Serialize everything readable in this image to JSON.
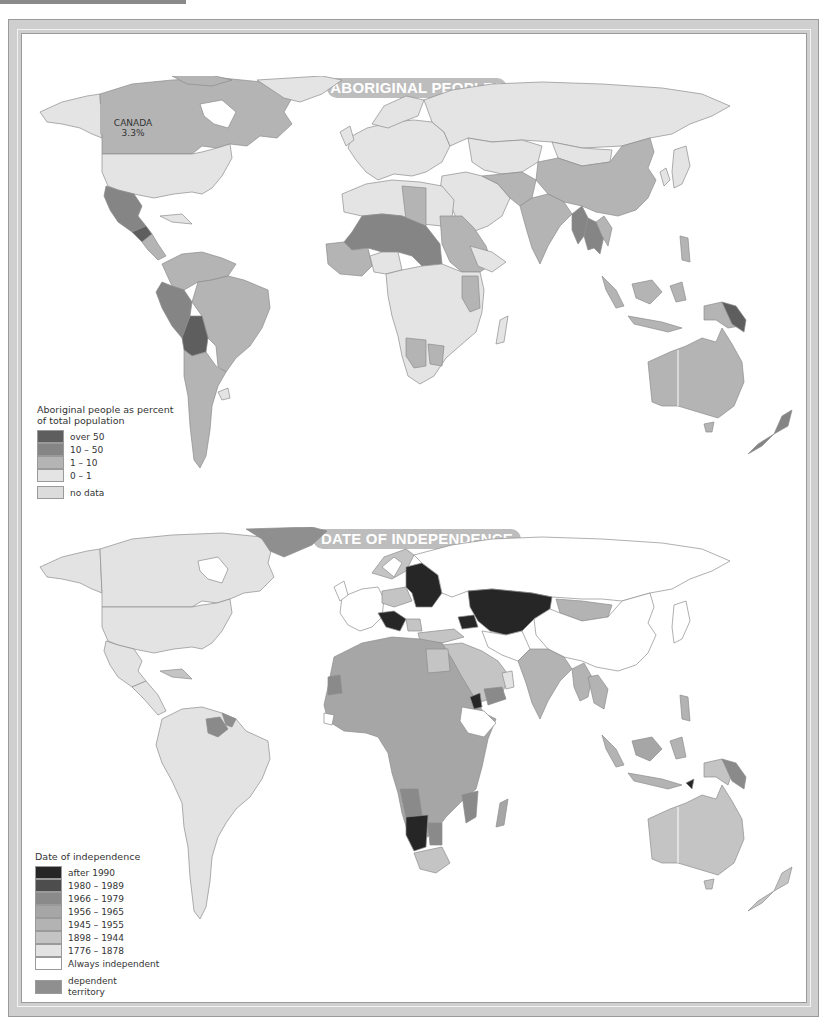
{
  "colors": {
    "frame": "#cfcfcf",
    "pill": "#bdbdbd",
    "sea": "#ffffff",
    "border": "#8c8c8c"
  },
  "maps": [
    {
      "title": "ABORIGINAL PEOPLES",
      "callout": {
        "country": "CANADA",
        "value": "3.3%"
      },
      "legend": {
        "title": "Aboriginal people as percent of total population",
        "items": [
          {
            "label": "over 50",
            "color": "#5e5e5e"
          },
          {
            "label": "10 – 50",
            "color": "#858585"
          },
          {
            "label": "1 – 10",
            "color": "#b4b4b4"
          },
          {
            "label": "0 – 1",
            "color": "#e4e4e4"
          },
          {
            "label": "no data",
            "color": "#dcdcdc"
          }
        ]
      }
    },
    {
      "title": "DATE OF INDEPENDENCE",
      "legend": {
        "title": "Date of independence",
        "items": [
          {
            "label": "after 1990",
            "color": "#262626"
          },
          {
            "label": "1980 – 1989",
            "color": "#4d4d4d"
          },
          {
            "label": "1966 – 1979",
            "color": "#8a8a8a"
          },
          {
            "label": "1956 – 1965",
            "color": "#a6a6a6"
          },
          {
            "label": "1945 – 1955",
            "color": "#b3b3b3"
          },
          {
            "label": "1898 – 1944",
            "color": "#c4c4c4"
          },
          {
            "label": "1776 – 1878",
            "color": "#e3e3e3"
          },
          {
            "label": "Always independent",
            "color": "#ffffff"
          },
          {
            "label": "dependent territory",
            "color": "#8f8f8f"
          }
        ]
      }
    }
  ]
}
